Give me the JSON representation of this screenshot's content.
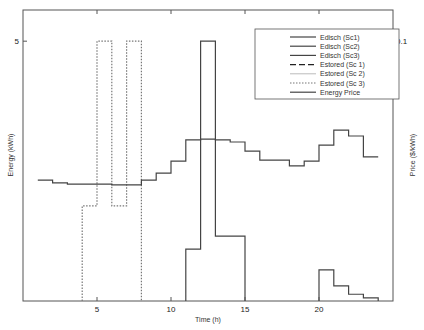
{
  "chart_data": {
    "type": "line",
    "title": "",
    "xlabel": "Time (h)",
    "ylabel": "Energy (kWh)",
    "ylabel_right": "Price ($/kWh)",
    "xlim": [
      0,
      25
    ],
    "ylim": [
      0,
      5.6
    ],
    "ylim_right": [
      0,
      0.112
    ],
    "x_ticks": [
      5,
      10,
      15,
      20
    ],
    "y_ticks": [
      5
    ],
    "y_ticks_right": [
      0.1
    ],
    "grid": false,
    "legend_position": "upper right",
    "legend": [
      "Edisch (Sc1)",
      "Edisch (Sc2)",
      "Edisch (Sc3)",
      "Estored (Sc 1)",
      "Estored (Sc 2)",
      "Estored (Sc 3)",
      "Energy Price"
    ],
    "series": [
      {
        "name": "Edisch (Sc1)",
        "style": "solid",
        "axis": "left",
        "steps": [
          [
            11,
            12,
            1.0
          ],
          [
            12,
            13,
            5.0
          ],
          [
            13,
            14,
            1.25
          ],
          [
            14,
            15,
            1.25
          ],
          [
            20,
            21,
            0.6
          ],
          [
            21,
            22,
            0.29
          ],
          [
            22,
            23,
            0.13
          ],
          [
            23,
            24,
            0.06
          ]
        ]
      },
      {
        "name": "Edisch (Sc2)",
        "style": "solid",
        "axis": "left",
        "steps": []
      },
      {
        "name": "Edisch (Sc3)",
        "style": "solid",
        "axis": "left",
        "steps": []
      },
      {
        "name": "Estored (Sc 1)",
        "style": "dashed",
        "axis": "left",
        "steps": []
      },
      {
        "name": "Estored (Sc 2)",
        "style": "dotted-light",
        "axis": "left",
        "steps": []
      },
      {
        "name": "Estored (Sc 3)",
        "style": "dotted",
        "axis": "left",
        "steps": [
          [
            4,
            5,
            1.83
          ],
          [
            5,
            6,
            5.0
          ],
          [
            6,
            7,
            1.83
          ],
          [
            7,
            8,
            5.0
          ]
        ]
      },
      {
        "name": "Energy Price",
        "style": "solid",
        "axis": "right",
        "steps": [
          [
            1,
            2,
            0.0465
          ],
          [
            2,
            3,
            0.0455
          ],
          [
            3,
            6,
            0.045
          ],
          [
            6,
            8,
            0.0447
          ],
          [
            8,
            9,
            0.0465
          ],
          [
            9,
            10,
            0.0492
          ],
          [
            10,
            11,
            0.0538
          ],
          [
            11,
            12,
            0.062
          ],
          [
            12,
            13,
            0.0623
          ],
          [
            13,
            14,
            0.062
          ],
          [
            14,
            15,
            0.0612
          ],
          [
            15,
            16,
            0.0577
          ],
          [
            16,
            17,
            0.0542
          ],
          [
            17,
            18,
            0.0542
          ],
          [
            18,
            19,
            0.052
          ],
          [
            19,
            20,
            0.0538
          ],
          [
            20,
            21,
            0.06
          ],
          [
            21,
            22,
            0.0658
          ],
          [
            22,
            23,
            0.0635
          ],
          [
            23,
            24,
            0.0555
          ]
        ]
      }
    ]
  }
}
